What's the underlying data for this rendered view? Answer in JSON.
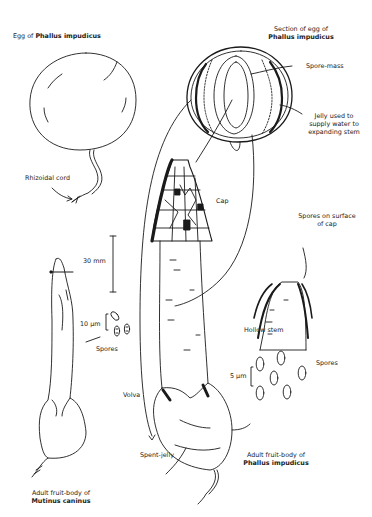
{
  "egg": {
    "title_prefix": "Egg of",
    "title_species": "Phallus impudicus",
    "rhizoidal_cord": "Rhizoidal cord"
  },
  "section": {
    "title_line1": "Section of egg of",
    "title_species": "Phallus impudicus",
    "spore_mass": "Spore-mass",
    "jelly_line1": "Jelly used to",
    "jelly_line2": "supply water to",
    "jelly_line3": "expanding stem"
  },
  "phallus": {
    "cap": "Cap",
    "spores_on_surface_line1": "Spores on surface",
    "spores_on_surface_line2": "of cap",
    "hollow_stem": "Hollow stem",
    "scale_spores": "5 µm",
    "spores": "Spores",
    "volva": "Volva",
    "spent_jelly": "Spent-jelly",
    "caption_line1": "Adult fruit-body of",
    "caption_species": "Phallus impudicus"
  },
  "mutinus": {
    "scale_body": "30 mm",
    "scale_spores": "10 µm",
    "spores": "Spores",
    "caption_line1": "Adult fruit-body of",
    "caption_species": "Mutinus caninus"
  }
}
